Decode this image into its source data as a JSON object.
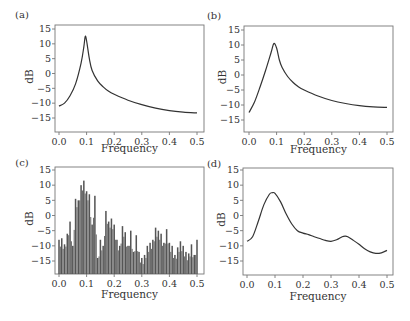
{
  "figure": {
    "panels": [
      {
        "id": "a",
        "label": "(a)",
        "ylabel": "dB",
        "xlabel": "Frequency"
      },
      {
        "id": "b",
        "label": "(b)",
        "ylabel": "dB",
        "xlabel": "Frequency"
      },
      {
        "id": "c",
        "label": "(c)",
        "ylabel": "dB",
        "xlabel": "Frequency"
      },
      {
        "id": "d",
        "label": "(d)",
        "ylabel": "dB",
        "xlabel": "Frequency"
      }
    ],
    "xticks": [
      "0.0",
      "0.1",
      "0.2",
      "0.3",
      "0.4",
      "0.5"
    ],
    "yticks": [
      "15",
      "10",
      "5",
      "0",
      "−15",
      "−10",
      "−5"
    ],
    "yticks_ordered": [
      "15",
      "10",
      "5",
      "0",
      "−5",
      "−10",
      "−15"
    ],
    "colors": {
      "line": "#333333",
      "bar": "#555555",
      "axis": "#777777"
    }
  },
  "chart_data": [
    {
      "panel": "a",
      "type": "line",
      "title": "(a)",
      "xlabel": "Frequency",
      "ylabel": "dB",
      "xlim": [
        0,
        0.5
      ],
      "ylim": [
        -19,
        16
      ],
      "grid": false,
      "xticks": [
        0.0,
        0.1,
        0.2,
        0.3,
        0.4,
        0.5
      ],
      "yticks": [
        -15,
        -10,
        -5,
        0,
        5,
        10,
        15
      ],
      "x": [
        0.0,
        0.02,
        0.04,
        0.06,
        0.08,
        0.09,
        0.095,
        0.1,
        0.11,
        0.12,
        0.14,
        0.16,
        0.18,
        0.2,
        0.25,
        0.3,
        0.35,
        0.4,
        0.45,
        0.5
      ],
      "y": [
        -11,
        -10,
        -7.5,
        -3.5,
        3.5,
        9,
        12.5,
        11,
        5,
        1,
        -2.5,
        -4.5,
        -6,
        -7,
        -9,
        -10.5,
        -11.7,
        -12.5,
        -13,
        -13.3
      ]
    },
    {
      "panel": "b",
      "type": "line",
      "title": "(b)",
      "xlabel": "Frequency",
      "ylabel": "dB",
      "xlim": [
        0,
        0.5
      ],
      "ylim": [
        -19,
        16
      ],
      "grid": false,
      "xticks": [
        0.0,
        0.1,
        0.2,
        0.3,
        0.4,
        0.5
      ],
      "yticks": [
        -15,
        -10,
        -5,
        0,
        5,
        10,
        15
      ],
      "x": [
        0.0,
        0.02,
        0.04,
        0.06,
        0.08,
        0.09,
        0.1,
        0.11,
        0.12,
        0.14,
        0.16,
        0.18,
        0.2,
        0.25,
        0.3,
        0.35,
        0.4,
        0.45,
        0.5
      ],
      "y": [
        -12.5,
        -9,
        -4,
        1.5,
        7.5,
        10.5,
        9,
        5,
        2.5,
        -0.5,
        -2.5,
        -4,
        -5,
        -7,
        -8.5,
        -9.5,
        -10.2,
        -10.6,
        -10.8
      ]
    },
    {
      "panel": "c",
      "type": "bar",
      "title": "(c)",
      "xlabel": "Frequency",
      "ylabel": "dB",
      "xlim": [
        0,
        0.5
      ],
      "ylim": [
        -19,
        16
      ],
      "grid": false,
      "xticks": [
        0.0,
        0.1,
        0.2,
        0.3,
        0.4,
        0.5
      ],
      "yticks": [
        -15,
        -10,
        -5,
        0,
        5,
        10,
        15
      ],
      "x": [
        0.0,
        0.01,
        0.02,
        0.03,
        0.04,
        0.05,
        0.06,
        0.07,
        0.08,
        0.09,
        0.1,
        0.11,
        0.12,
        0.13,
        0.14,
        0.15,
        0.16,
        0.17,
        0.18,
        0.19,
        0.2,
        0.21,
        0.22,
        0.23,
        0.24,
        0.25,
        0.26,
        0.27,
        0.28,
        0.29,
        0.3,
        0.31,
        0.32,
        0.33,
        0.34,
        0.35,
        0.36,
        0.37,
        0.38,
        0.39,
        0.4,
        0.41,
        0.42,
        0.43,
        0.44,
        0.45,
        0.46,
        0.47,
        0.48,
        0.49,
        0.5
      ],
      "y": [
        -8,
        -7.5,
        -9.5,
        -6,
        -2,
        -10,
        5.5,
        5,
        10,
        11.5,
        8,
        7,
        -3,
        6.5,
        -14,
        -8,
        -10,
        1.5,
        -2,
        -1,
        -3,
        -8,
        -10,
        -3.5,
        -5.5,
        -10,
        -5,
        -12,
        -6.5,
        -12,
        -14,
        -13,
        -10,
        -9,
        -8,
        -4,
        -5,
        -6,
        -9,
        -4.5,
        -9,
        -10,
        -13,
        -10.5,
        -8.5,
        -10,
        -12,
        -12.5,
        -9.5,
        -13,
        -8
      ]
    },
    {
      "panel": "d",
      "type": "line",
      "title": "(d)",
      "xlabel": "Frequency",
      "ylabel": "dB",
      "xlim": [
        0,
        0.5
      ],
      "ylim": [
        -19,
        16
      ],
      "grid": false,
      "xticks": [
        0.0,
        0.1,
        0.2,
        0.3,
        0.4,
        0.5
      ],
      "yticks": [
        -15,
        -10,
        -5,
        0,
        5,
        10,
        15
      ],
      "x": [
        0.0,
        0.02,
        0.04,
        0.06,
        0.08,
        0.09,
        0.1,
        0.12,
        0.14,
        0.16,
        0.18,
        0.2,
        0.22,
        0.24,
        0.26,
        0.28,
        0.3,
        0.32,
        0.34,
        0.35,
        0.36,
        0.38,
        0.4,
        0.42,
        0.44,
        0.46,
        0.48,
        0.5
      ],
      "y": [
        -8.5,
        -7,
        -2,
        3.5,
        7,
        7.5,
        7.3,
        4.5,
        0.5,
        -2.8,
        -5,
        -5.8,
        -6.3,
        -7,
        -7.6,
        -8.2,
        -8.5,
        -8,
        -7,
        -6.8,
        -7,
        -8.2,
        -9.5,
        -11,
        -12,
        -12.5,
        -12.3,
        -11.5
      ]
    }
  ]
}
